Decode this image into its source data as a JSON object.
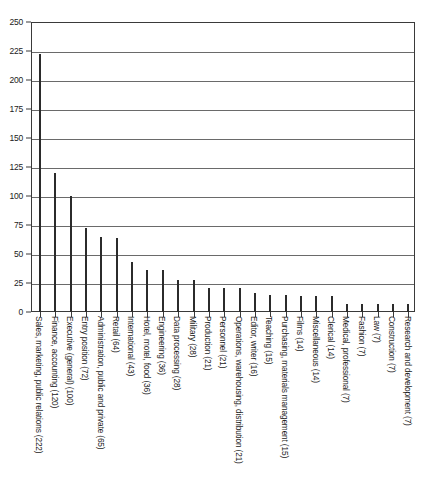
{
  "chart_data": {
    "type": "bar",
    "title": "",
    "subtitle": "",
    "xlabel": "",
    "ylabel": "",
    "ylim": [
      0,
      250
    ],
    "ytick_step": 25,
    "yticks": [
      "0",
      "25",
      "50",
      "75",
      "100",
      "125",
      "150",
      "175",
      "200",
      "225",
      "250"
    ],
    "grid": true,
    "grid_axis": "y",
    "legend": false,
    "legend_position": "none",
    "orientation": "vertical",
    "bar_color": "#2b2b2b",
    "categories": [
      "Sales, marketing, public relations (222)",
      "Finance, accounting (120)",
      "Executive (general) (100)",
      "Entry position (72)",
      "Administration, public and private (65)",
      "Retail (64)",
      "International (43)",
      "Hotel, motel, food (36)",
      "Engineering (36)",
      "Data processing (28)",
      "Military (28)",
      "Production (21)",
      "Personnel (21)",
      "Operations, warehousing, distribution (21)",
      "Editor, writer (16)",
      "Teaching (15)",
      "Purchasing, materials management (15)",
      "Films (14)",
      "Miscellaneous (14)",
      "Clerical (14)",
      "Medical, professional (7)",
      "Fashion (7)",
      "Law (7)",
      "Construction (7)",
      "Research and development (7)"
    ],
    "values": [
      222,
      120,
      100,
      72,
      65,
      64,
      43,
      36,
      36,
      28,
      28,
      21,
      21,
      21,
      16,
      15,
      15,
      14,
      14,
      14,
      7,
      7,
      7,
      7,
      7
    ]
  }
}
